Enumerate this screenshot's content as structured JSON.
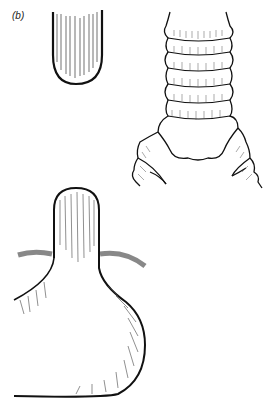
{
  "figure": {
    "panel_label": "(b)",
    "subfigures": [
      {
        "name": "tube-tip",
        "description": "Cylindrical tube with rounded closed end, striated longitudinally"
      },
      {
        "name": "ringed-bifurcation",
        "description": "Ringed tube bifurcating into two ringed branches"
      },
      {
        "name": "bulb-flask",
        "description": "Flask-shaped bulb with narrow neck crossed by a band"
      }
    ],
    "colors": {
      "ink": "#111111",
      "background": "#ffffff",
      "band": "#999999"
    }
  }
}
